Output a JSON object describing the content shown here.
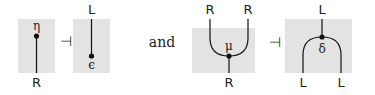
{
  "diagram": {
    "connector_word": "and",
    "adjoint_symbol": "⊣",
    "colors": {
      "box_fill": "#e3e3e3",
      "stroke": "#111111",
      "text": "#222222"
    },
    "left_pair": {
      "unit": {
        "label": "η",
        "bottom_label": "R"
      },
      "counit": {
        "label": "ϵ",
        "top_label": "L"
      }
    },
    "right_pair": {
      "multiplication": {
        "label": "μ",
        "top_labels": [
          "R",
          "R"
        ],
        "bottom_label": "R"
      },
      "comultiplication": {
        "label": "δ",
        "top_label": "L",
        "bottom_labels": [
          "L",
          "L"
        ]
      }
    }
  }
}
